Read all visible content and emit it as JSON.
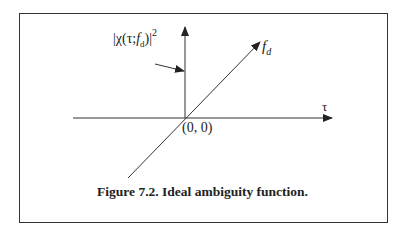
{
  "figure": {
    "caption": "Figure 7.2. Ideal ambiguity function.",
    "labels": {
      "vertical_axis": {
        "prefix": "|χ(τ;",
        "var": "f",
        "sub": "d",
        "suffix": ")|",
        "power": "2"
      },
      "diagonal_axis": {
        "var": "f",
        "sub": "d"
      },
      "horizontal_axis": "τ",
      "origin": "(0, 0)"
    },
    "colors": {
      "line": "#333333",
      "text": "#222222",
      "background": "#ffffff"
    }
  }
}
